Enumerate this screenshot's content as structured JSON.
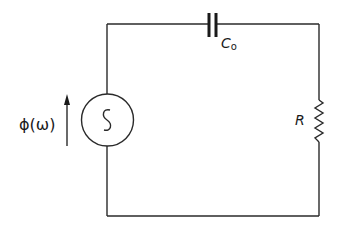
{
  "diagram": {
    "type": "circuit",
    "colors": {
      "background": "#ffffff",
      "ink": "#1a1a1a"
    },
    "components": {
      "source": {
        "kind": "ac-voltage-source",
        "symbol": "~",
        "label": "ϕ(ω)",
        "arrow_direction": "up"
      },
      "capacitor": {
        "kind": "capacitor",
        "label_main": "C",
        "label_sub": "o"
      },
      "resistor": {
        "kind": "resistor",
        "label": "R"
      }
    },
    "topology": [
      "source (left branch)",
      "capacitor (top branch)",
      "resistor (right branch)",
      "wire (bottom branch)"
    ]
  }
}
